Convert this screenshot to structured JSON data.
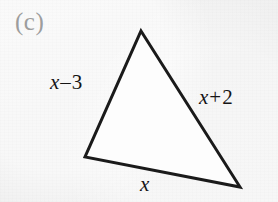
{
  "figure": {
    "part_label": "(c)",
    "part_label_color": "#9d9d9d",
    "background_color": "#f1f1f1",
    "stroke_color": "#1a1a1a",
    "fill_color": "#fdfdfd",
    "stroke_width": 3
  },
  "triangle": {
    "vertices": {
      "apex": {
        "x": 141,
        "y": 31
      },
      "bottom_left": {
        "x": 85,
        "y": 157
      },
      "bottom_right": {
        "x": 240,
        "y": 187
      }
    },
    "points": "141,31 240,187 85,157"
  },
  "labels": {
    "left": {
      "var": "x",
      "op": "–",
      "num": "3",
      "text": "x – 3"
    },
    "right": {
      "var": "x",
      "op": "+",
      "num": "2",
      "text": "x + 2"
    },
    "bottom": {
      "var": "x",
      "text": "x"
    }
  }
}
